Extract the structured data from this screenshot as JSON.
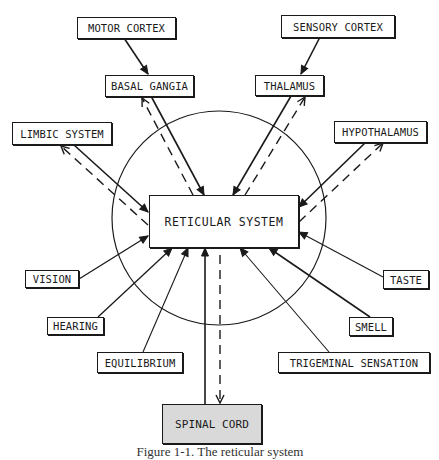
{
  "diagram": {
    "center": {
      "label": "RETICULAR SYSTEM"
    },
    "nodes": {
      "motor_cortex": "MOTOR CORTEX",
      "sensory_cortex": "SENSORY CORTEX",
      "basal_gangia": "BASAL GANGIA",
      "thalamus": "THALAMUS",
      "limbic_system": "LIMBIC SYSTEM",
      "hypothalamus": "HYPOTHALAMUS",
      "vision": "VISION",
      "taste": "TASTE",
      "hearing": "HEARING",
      "smell": "SMELL",
      "equilibrium": "EQUILIBRIUM",
      "trigeminal_sensation": "TRIGEMINAL SENSATION",
      "spinal_cord": "SPINAL CORD"
    },
    "caption": "Figure 1-1. The reticular system"
  }
}
